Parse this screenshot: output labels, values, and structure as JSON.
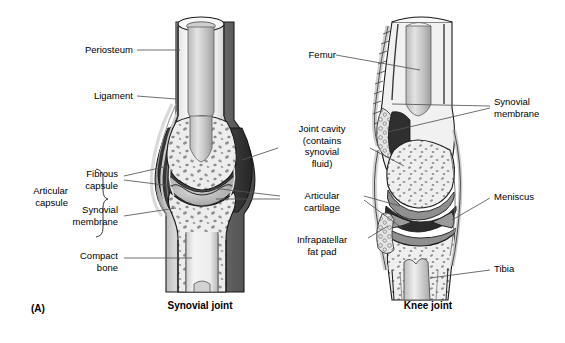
{
  "figure": {
    "panel_letter": "(A)",
    "background_color": "#ffffff",
    "ink_color": "#000000",
    "leader_line_color": "#555555",
    "width": 565,
    "height": 343
  },
  "captions": [
    {
      "id": "synovial-joint",
      "text": "Synovial joint",
      "x": 200,
      "y": 305
    },
    {
      "id": "knee-joint",
      "text": "Knee joint",
      "x": 428,
      "y": 305
    }
  ],
  "labels": [
    {
      "id": "periosteum",
      "text": "Periosteum",
      "x": 133,
      "y": 50,
      "align": "right"
    },
    {
      "id": "ligament",
      "text": "Ligament",
      "x": 133,
      "y": 96,
      "align": "right"
    },
    {
      "id": "fibrous-capsule",
      "text": "Fibrous\ncapsule",
      "x": 118,
      "y": 180,
      "align": "right"
    },
    {
      "id": "synovial-membrane-left",
      "text": "Synovial\nmembrane",
      "x": 118,
      "y": 215,
      "align": "right"
    },
    {
      "id": "articular-capsule",
      "text": "Articular\ncapsule",
      "x": 68,
      "y": 191,
      "align": "right"
    },
    {
      "id": "compact-bone",
      "text": "Compact\nbone",
      "x": 118,
      "y": 258,
      "align": "right"
    },
    {
      "id": "joint-cavity",
      "text": "Joint cavity\n(contains\nsynovial\nfluid)",
      "x": 322,
      "y": 126,
      "align": "center"
    },
    {
      "id": "articular-cartilage",
      "text": "Articular\ncartilage",
      "x": 322,
      "y": 197,
      "align": "center"
    },
    {
      "id": "infrapatellar-fat-pad",
      "text": "Infrapatellar\nfat pad",
      "x": 322,
      "y": 241,
      "align": "center"
    },
    {
      "id": "femur",
      "text": "Femur",
      "x": 330,
      "y": 55,
      "align": "right"
    },
    {
      "id": "synovial-membrane-right",
      "text": "Synovial\nmembrane",
      "x": 494,
      "y": 102,
      "align": "left"
    },
    {
      "id": "meniscus",
      "text": "Meniscus",
      "x": 494,
      "y": 196,
      "align": "left"
    },
    {
      "id": "tibia",
      "text": "Tibia",
      "x": 494,
      "y": 268,
      "align": "left"
    }
  ],
  "palette": {
    "bone_outer": "#f2f2f2",
    "bone_shadow": "#8c8c8c",
    "spongy_fill": "#ebebeb",
    "spongy_speckle": "#8a8a8a",
    "marrow_gradient_light": "#d8d8d8",
    "marrow_gradient_dark": "#9a9a9a",
    "cavity_dark": "#3b3b3b",
    "capsule_mid": "#5e5e5e",
    "capsule_light": "#cfcfcf",
    "cartilage": "#b9b9b9",
    "outline": "#1a1a1a"
  }
}
